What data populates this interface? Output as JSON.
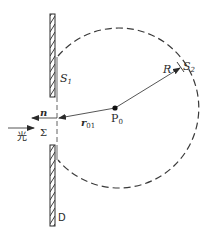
{
  "diagram": {
    "title": "",
    "colors": {
      "line": "#2a2a2a",
      "dash": "#3a3a3a",
      "background": "#ffffff"
    },
    "labels": {
      "s1": "S",
      "s1_sub": "1",
      "s2": "S",
      "s2_sub": "2",
      "radius": "R",
      "point": "P",
      "point_sub": "0",
      "normal": "n",
      "r": "r",
      "r_sub": "01",
      "aperture": "Σ",
      "light": "光",
      "screen": "D"
    },
    "elements": [
      {
        "id": "screen-upper",
        "type": "hatched-bar"
      },
      {
        "id": "screen-lower",
        "type": "hatched-bar"
      },
      {
        "id": "aperture-axis",
        "type": "dashed-line"
      },
      {
        "id": "sphere-s2",
        "type": "dashed-arc"
      },
      {
        "id": "normal-arrow",
        "type": "arrow",
        "label": "n"
      },
      {
        "id": "r01-arrow",
        "type": "arrow",
        "label": "r01"
      },
      {
        "id": "radius-arrow",
        "type": "arrow",
        "label": "R"
      },
      {
        "id": "light-arrow",
        "type": "arrow",
        "label": "光"
      },
      {
        "id": "point-p0",
        "type": "point",
        "label": "P0"
      }
    ]
  }
}
